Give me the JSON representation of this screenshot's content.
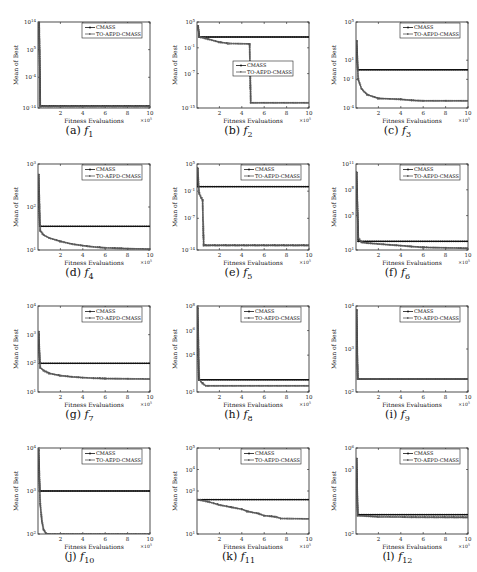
{
  "figure": {
    "legend": [
      "CMASS",
      "TO-AEPD-CMASS"
    ],
    "xlabel": "Fitness Evaluations",
    "ylabel": "Mean of Best",
    "x_multiplier": "×10^5",
    "xticks": [
      "2",
      "4",
      "6",
      "8",
      "10"
    ]
  },
  "colors": {
    "cmass": "#111111",
    "toaepd": "#555555",
    "axis": "#222222"
  },
  "chart_data": [
    {
      "id": "a",
      "caption_letter": "(a)",
      "fn": "f",
      "fn_sub": "1",
      "type": "line",
      "yscale": "log",
      "title": "",
      "xlabel": "Fitness Evaluations",
      "ylabel": "Mean of Best",
      "xlim": [
        0,
        10
      ],
      "ylim_exp": [
        -14,
        14
      ],
      "yticks": [
        "10^14",
        "10^5",
        "10^-4",
        "10^-14"
      ],
      "ytick_exp": [
        14,
        5,
        -4,
        -14
      ],
      "legend_pos": "top-right",
      "series": [
        {
          "name": "CMASS",
          "x": [
            0,
            0.1,
            0.2,
            10
          ],
          "log_y": [
            14,
            14,
            -13.3,
            -13.3
          ]
        },
        {
          "name": "TO-AEPD-CMASS",
          "x": [
            0,
            0.1,
            0.2,
            10
          ],
          "log_y": [
            14,
            14,
            -13.5,
            -13.5
          ]
        }
      ]
    },
    {
      "id": "b",
      "caption_letter": "(b)",
      "fn": "f",
      "fn_sub": "2",
      "type": "line",
      "yscale": "log",
      "title": "",
      "xlabel": "Fitness Evaluations",
      "ylabel": "Mean of Best",
      "xlim": [
        0,
        10
      ],
      "ylim_exp": [
        -15,
        5
      ],
      "yticks": [
        "10^5",
        "10^-1",
        "10^-7",
        "10^-15"
      ],
      "ytick_exp": [
        5,
        -1,
        -7,
        -15
      ],
      "legend_pos": "center",
      "series": [
        {
          "name": "CMASS",
          "x": [
            0,
            0.1,
            0.2,
            10
          ],
          "log_y": [
            4,
            4,
            1.5,
            1.5
          ]
        },
        {
          "name": "TO-AEPD-CMASS",
          "x": [
            0,
            0.1,
            0.2,
            1.0,
            2.0,
            2.8,
            4.6,
            4.7,
            4.8,
            10
          ],
          "log_y": [
            4,
            4,
            1.5,
            1.0,
            0.3,
            0,
            -0.1,
            -0.2,
            -13.8,
            -13.8
          ]
        }
      ]
    },
    {
      "id": "c",
      "caption_letter": "(c)",
      "fn": "f",
      "fn_sub": "3",
      "type": "line",
      "yscale": "log",
      "title": "",
      "xlabel": "Fitness Evaluations",
      "ylabel": "Mean of Best",
      "xlim": [
        0,
        10
      ],
      "ylim_exp": [
        -4,
        5
      ],
      "yticks": [
        "10^5",
        "10^1",
        "10^-1",
        "10^-4"
      ],
      "ytick_exp": [
        5,
        1,
        -1,
        -4
      ],
      "legend_pos": "top-right",
      "series": [
        {
          "name": "CMASS",
          "x": [
            0,
            0.05,
            0.15,
            10
          ],
          "log_y": [
            3,
            3,
            0,
            0
          ]
        },
        {
          "name": "TO-AEPD-CMASS",
          "x": [
            0,
            0.05,
            0.2,
            0.5,
            1,
            2,
            3,
            4,
            5,
            6,
            8,
            10
          ],
          "log_y": [
            3,
            3,
            -1,
            -2,
            -2.6,
            -3.0,
            -3.05,
            -3.1,
            -3.2,
            -3.25,
            -3.25,
            -3.25
          ]
        }
      ]
    },
    {
      "id": "d",
      "caption_letter": "(d)",
      "fn": "f",
      "fn_sub": "4",
      "type": "line",
      "yscale": "log",
      "title": "",
      "xlabel": "Fitness Evaluations",
      "ylabel": "Mean of Best",
      "xlim": [
        0,
        10
      ],
      "ylim_exp": [
        1,
        3
      ],
      "yticks": [
        "10^3",
        "10^2",
        "10^1"
      ],
      "ytick_exp": [
        3,
        2,
        1
      ],
      "legend_pos": "top-right",
      "series": [
        {
          "name": "CMASS",
          "x": [
            0,
            0.05,
            0.15,
            10
          ],
          "log_y": [
            2.75,
            2.75,
            1.55,
            1.55
          ]
        },
        {
          "name": "TO-AEPD-CMASS",
          "x": [
            0,
            0.05,
            0.2,
            0.5,
            1,
            2,
            3,
            4,
            5,
            6,
            8,
            10
          ],
          "log_y": [
            2.75,
            2.75,
            1.45,
            1.35,
            1.28,
            1.2,
            1.14,
            1.1,
            1.07,
            1.05,
            1.03,
            1.02
          ]
        }
      ]
    },
    {
      "id": "e",
      "caption_letter": "(e)",
      "fn": "f",
      "fn_sub": "5",
      "type": "line",
      "yscale": "log",
      "title": "",
      "xlabel": "Fitness Evaluations",
      "ylabel": "Mean of Best",
      "xlim": [
        0,
        10
      ],
      "ylim_exp": [
        -14,
        5
      ],
      "yticks": [
        "10^5",
        "10^-1",
        "10^-7",
        "10^-14"
      ],
      "ytick_exp": [
        5,
        -1,
        -7,
        -14
      ],
      "legend_pos": "top-right",
      "series": [
        {
          "name": "CMASS",
          "x": [
            0,
            0.05,
            0.1,
            10
          ],
          "log_y": [
            4,
            4,
            0,
            0
          ]
        },
        {
          "name": "TO-AEPD-CMASS",
          "x": [
            0,
            0.05,
            0.2,
            0.4,
            0.5,
            0.6,
            10
          ],
          "log_y": [
            4,
            4,
            -1.5,
            -2.5,
            -3,
            -13,
            -13
          ]
        }
      ]
    },
    {
      "id": "f",
      "caption_letter": "(f)",
      "fn": "f",
      "fn_sub": "6",
      "type": "line",
      "yscale": "log",
      "title": "",
      "xlabel": "Fitness Evaluations",
      "ylabel": "Mean of Best",
      "xlim": [
        0,
        10
      ],
      "ylim_exp": [
        1,
        11
      ],
      "yticks": [
        "10^11",
        "10^8",
        "10^5",
        "10^1"
      ],
      "ytick_exp": [
        11,
        8,
        5,
        1
      ],
      "legend_pos": "top-right",
      "series": [
        {
          "name": "CMASS",
          "x": [
            0,
            0.05,
            0.2,
            10
          ],
          "log_y": [
            10,
            10,
            2.0,
            2.0
          ]
        },
        {
          "name": "TO-AEPD-CMASS",
          "x": [
            0,
            0.05,
            0.2,
            0.5,
            1,
            2,
            3,
            4,
            5,
            6,
            8,
            10
          ],
          "log_y": [
            10,
            10,
            2.4,
            1.9,
            1.8,
            1.7,
            1.6,
            1.5,
            1.4,
            1.3,
            1.25,
            1.2
          ]
        }
      ]
    },
    {
      "id": "g",
      "caption_letter": "(g)",
      "fn": "f",
      "fn_sub": "7",
      "type": "line",
      "yscale": "log",
      "title": "",
      "xlabel": "Fitness Evaluations",
      "ylabel": "Mean of Best",
      "xlim": [
        0,
        10
      ],
      "ylim_exp": [
        1,
        4
      ],
      "yticks": [
        "10^4",
        "10^3",
        "10^2",
        "10^1"
      ],
      "ytick_exp": [
        4,
        3,
        2,
        1
      ],
      "legend_pos": "top-right",
      "series": [
        {
          "name": "CMASS",
          "x": [
            0,
            0.05,
            0.15,
            10
          ],
          "log_y": [
            3.1,
            3.1,
            2.0,
            2.0
          ]
        },
        {
          "name": "TO-AEPD-CMASS",
          "x": [
            0,
            0.05,
            0.2,
            0.5,
            1,
            2,
            3,
            4,
            5,
            6,
            8,
            10
          ],
          "log_y": [
            3.1,
            3.1,
            1.85,
            1.75,
            1.65,
            1.57,
            1.53,
            1.5,
            1.48,
            1.47,
            1.46,
            1.45
          ]
        }
      ]
    },
    {
      "id": "h",
      "caption_letter": "(h)",
      "fn": "f",
      "fn_sub": "8",
      "type": "line",
      "yscale": "log",
      "title": "",
      "xlabel": "Fitness Evaluations",
      "ylabel": "Mean of Best",
      "xlim": [
        0,
        10
      ],
      "ylim_exp": [
        1,
        8
      ],
      "yticks": [
        "10^8",
        "10^6",
        "10^4",
        "10^1"
      ],
      "ytick_exp": [
        8,
        6,
        4,
        1
      ],
      "legend_pos": "top-right",
      "series": [
        {
          "name": "CMASS",
          "x": [
            0,
            0.05,
            0.15,
            10
          ],
          "log_y": [
            7.8,
            7.8,
            2.0,
            2.0
          ]
        },
        {
          "name": "TO-AEPD-CMASS",
          "x": [
            0,
            0.05,
            0.2,
            0.5,
            0.8,
            1,
            10
          ],
          "log_y": [
            7.8,
            7.8,
            2.0,
            1.7,
            1.5,
            1.5,
            1.5
          ]
        }
      ]
    },
    {
      "id": "i",
      "caption_letter": "(i)",
      "fn": "f",
      "fn_sub": "9",
      "type": "line",
      "yscale": "log",
      "title": "",
      "xlabel": "Fitness Evaluations",
      "ylabel": "Mean of Best",
      "xlim": [
        0,
        10
      ],
      "ylim_exp": [
        2,
        4
      ],
      "yticks": [
        "10^4",
        "10^3",
        "10^2"
      ],
      "ytick_exp": [
        4,
        3,
        2
      ],
      "legend_pos": "top-right",
      "series": [
        {
          "name": "CMASS",
          "x": [
            0,
            0.05,
            0.15,
            10
          ],
          "log_y": [
            3.9,
            3.9,
            2.3,
            2.3
          ]
        },
        {
          "name": "TO-AEPD-CMASS",
          "x": [
            0,
            0.05,
            0.15,
            10
          ],
          "log_y": [
            3.9,
            3.9,
            2.3,
            2.3
          ]
        }
      ]
    },
    {
      "id": "j",
      "caption_letter": "(j)",
      "fn": "f",
      "fn_sub": "10",
      "type": "line",
      "yscale": "log",
      "title": "",
      "xlabel": "Fitness Evaluations",
      "ylabel": "Mean of Best",
      "xlim": [
        0,
        10
      ],
      "ylim_exp": [
        2,
        4
      ],
      "yticks": [
        "10^4",
        "10^3",
        "10^2"
      ],
      "ytick_exp": [
        4,
        3,
        2
      ],
      "legend_pos": "top-right",
      "series": [
        {
          "name": "CMASS",
          "x": [
            0,
            0.05,
            0.15,
            10
          ],
          "log_y": [
            3.95,
            3.95,
            3.0,
            3.0
          ]
        },
        {
          "name": "TO-AEPD-CMASS",
          "x": [
            0,
            0.05,
            0.2,
            0.35,
            0.5,
            0.7,
            1,
            10
          ],
          "log_y": [
            3.95,
            3.95,
            2.7,
            2.3,
            2.1,
            2.02,
            2.0,
            2.0
          ]
        }
      ]
    },
    {
      "id": "k",
      "caption_letter": "(k)",
      "fn": "f",
      "fn_sub": "11",
      "type": "line",
      "yscale": "log",
      "title": "",
      "xlabel": "Fitness Evaluations",
      "ylabel": "Mean of Best",
      "xlim": [
        0,
        10
      ],
      "ylim_exp": [
        1,
        5
      ],
      "yticks": [
        "10^5",
        "10^4",
        "10^3",
        "10^1"
      ],
      "ytick_exp": [
        5,
        4,
        3,
        1
      ],
      "legend_pos": "top-right",
      "series": [
        {
          "name": "CMASS",
          "x": [
            0,
            10
          ],
          "log_y": [
            2.6,
            2.6
          ]
        },
        {
          "name": "TO-AEPD-CMASS",
          "x": [
            0,
            1,
            2,
            3,
            4,
            4.5,
            5.5,
            6,
            7,
            7.5,
            10
          ],
          "log_y": [
            2.6,
            2.5,
            2.35,
            2.25,
            2.15,
            2.05,
            1.95,
            1.85,
            1.8,
            1.72,
            1.7
          ]
        }
      ]
    },
    {
      "id": "l",
      "caption_letter": "(l)",
      "fn": "f",
      "fn_sub": "12",
      "type": "line",
      "yscale": "log",
      "title": "",
      "xlabel": "Fitness Evaluations",
      "ylabel": "Mean of Best",
      "xlim": [
        0,
        10
      ],
      "ylim_exp": [
        2,
        6
      ],
      "yticks": [
        "10^6",
        "10^5",
        "10^2"
      ],
      "ytick_exp": [
        6,
        5,
        2
      ],
      "legend_pos": "top-right",
      "series": [
        {
          "name": "CMASS",
          "x": [
            0,
            0.05,
            0.15,
            10
          ],
          "log_y": [
            5.5,
            5.5,
            2.9,
            2.9
          ]
        },
        {
          "name": "TO-AEPD-CMASS",
          "x": [
            0,
            0.05,
            0.15,
            2,
            5,
            10
          ],
          "log_y": [
            5.5,
            5.5,
            2.85,
            2.8,
            2.78,
            2.77
          ]
        }
      ]
    }
  ]
}
